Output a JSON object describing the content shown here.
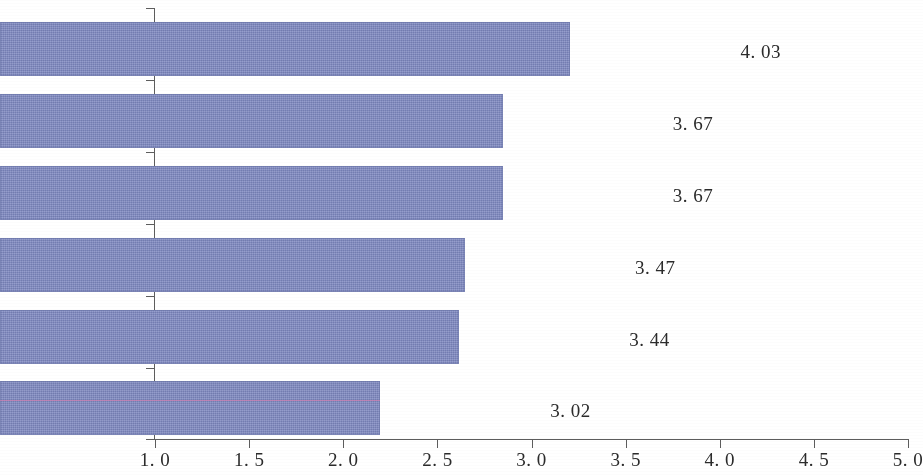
{
  "chart_data": {
    "type": "bar",
    "orientation": "horizontal",
    "title": "",
    "subtitle": "",
    "xlabel": "",
    "ylabel": "",
    "categories": [
      "互联网安全",
      "信息与数据素养",
      "交流合作",
      "设备与软件操作",
      "策略性学习",
      "内容创造"
    ],
    "values": [
      4.03,
      3.67,
      3.67,
      3.47,
      3.44,
      3.02
    ],
    "value_labels": [
      "4. 03",
      "3. 67",
      "3. 67",
      "3. 47",
      "3. 44",
      "3. 02"
    ],
    "xlim": [
      1.0,
      5.0
    ],
    "xticks": [
      1.0,
      1.5,
      2.0,
      2.5,
      3.0,
      3.5,
      4.0,
      4.5,
      5.0
    ],
    "xtick_labels": [
      "1. 0",
      "1. 5",
      "2. 0",
      "2. 5",
      "3. 0",
      "3. 5",
      "4. 0",
      "4. 5",
      "5. 0"
    ],
    "grid": false,
    "legend": null,
    "series": [
      {
        "name": "",
        "values": [
          4.03,
          3.67,
          3.67,
          3.47,
          3.44,
          3.02
        ]
      }
    ],
    "bar_color": "#7d87c0",
    "axis_color": "#5d5d5d",
    "background_color": "#ffffff",
    "text_color": "#2b2b2b"
  }
}
